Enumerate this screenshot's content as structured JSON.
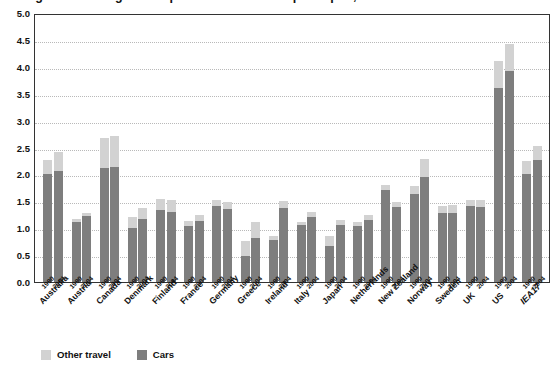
{
  "chart_data": {
    "type": "bar",
    "title": "Figure: Passenger transport CO2 emissions per capita, 1990 and 2004",
    "subtitle": "",
    "xlabel": "",
    "ylabel": "t CO2 per capita",
    "ylim": [
      0.0,
      5.0
    ],
    "ytick_step": 0.5,
    "ytick_labels": [
      "0.0",
      "0.5",
      "1.0",
      "1.5",
      "2.0",
      "2.5",
      "3.0",
      "3.5",
      "4.0",
      "4.5",
      "5.0"
    ],
    "grid": true,
    "stacked": true,
    "legend_position": "bottom-left",
    "legend": [
      "Other travel",
      "Cars"
    ],
    "series": [
      {
        "name": "Cars",
        "color": "#7e7e7e"
      },
      {
        "name": "Other travel",
        "color": "#d2d2d2"
      }
    ],
    "year_labels": [
      "1990",
      "2004"
    ],
    "categories": [
      "Australia",
      "Austria",
      "Canada",
      "Denmark",
      "Finland",
      "France",
      "Germany",
      "Greece",
      "Ireland",
      "Italy",
      "Japan",
      "Netherlands",
      "New Zealand",
      "Norway",
      "Sweden",
      "UK",
      "US",
      "IEA17"
    ],
    "emphasized_categories": [
      "IEA17"
    ],
    "groups": [
      {
        "category": "Australia",
        "emphasis": false,
        "bars": [
          {
            "year": "1990",
            "cars": 2.0,
            "other": 0.26,
            "total": 2.26
          },
          {
            "year": "2004",
            "cars": 2.07,
            "other": 0.35,
            "total": 2.42
          }
        ]
      },
      {
        "category": "Austria",
        "emphasis": false,
        "bars": [
          {
            "year": "1990",
            "cars": 1.11,
            "other": 0.07,
            "total": 1.18
          },
          {
            "year": "2004",
            "cars": 1.22,
            "other": 0.07,
            "total": 1.29
          }
        ]
      },
      {
        "category": "Canada",
        "emphasis": false,
        "bars": [
          {
            "year": "1990",
            "cars": 2.12,
            "other": 0.55,
            "total": 2.67
          },
          {
            "year": "2004",
            "cars": 2.13,
            "other": 0.59,
            "total": 2.72
          }
        ]
      },
      {
        "category": "Denmark",
        "emphasis": false,
        "bars": [
          {
            "year": "1990",
            "cars": 1.0,
            "other": 0.21,
            "total": 1.21
          },
          {
            "year": "2004",
            "cars": 1.18,
            "other": 0.2,
            "total": 1.38
          }
        ]
      },
      {
        "category": "Finland",
        "emphasis": false,
        "bars": [
          {
            "year": "1990",
            "cars": 1.34,
            "other": 0.21,
            "total": 1.55
          },
          {
            "year": "2004",
            "cars": 1.31,
            "other": 0.21,
            "total": 1.52
          }
        ]
      },
      {
        "category": "France",
        "emphasis": false,
        "bars": [
          {
            "year": "1990",
            "cars": 1.04,
            "other": 0.1,
            "total": 1.14
          },
          {
            "year": "2004",
            "cars": 1.14,
            "other": 0.1,
            "total": 1.24
          }
        ]
      },
      {
        "category": "Germany",
        "emphasis": false,
        "bars": [
          {
            "year": "1990",
            "cars": 1.41,
            "other": 0.11,
            "total": 1.52
          },
          {
            "year": "2004",
            "cars": 1.35,
            "other": 0.14,
            "total": 1.49
          }
        ]
      },
      {
        "category": "Greece",
        "emphasis": false,
        "bars": [
          {
            "year": "1990",
            "cars": 0.48,
            "other": 0.28,
            "total": 0.76
          },
          {
            "year": "2004",
            "cars": 0.82,
            "other": 0.3,
            "total": 1.12
          }
        ]
      },
      {
        "category": "Ireland",
        "emphasis": false,
        "bars": [
          {
            "year": "1990",
            "cars": 0.78,
            "other": 0.08,
            "total": 0.86
          },
          {
            "year": "2004",
            "cars": 1.38,
            "other": 0.13,
            "total": 1.51
          }
        ]
      },
      {
        "category": "Italy",
        "emphasis": false,
        "bars": [
          {
            "year": "1990",
            "cars": 1.06,
            "other": 0.06,
            "total": 1.12
          },
          {
            "year": "2004",
            "cars": 1.2,
            "other": 0.11,
            "total": 1.31
          }
        ]
      },
      {
        "category": "Japan",
        "emphasis": false,
        "bars": [
          {
            "year": "1990",
            "cars": 0.67,
            "other": 0.18,
            "total": 0.85
          },
          {
            "year": "2004",
            "cars": 1.06,
            "other": 0.1,
            "total": 1.16
          }
        ]
      },
      {
        "category": "Netherlands",
        "emphasis": false,
        "bars": [
          {
            "year": "1990",
            "cars": 1.05,
            "other": 0.07,
            "total": 1.12
          },
          {
            "year": "2004",
            "cars": 1.15,
            "other": 0.1,
            "total": 1.25
          }
        ]
      },
      {
        "category": "New Zealand",
        "emphasis": false,
        "bars": [
          {
            "year": "1990",
            "cars": 1.71,
            "other": 0.09,
            "total": 1.8
          },
          {
            "year": "2004",
            "cars": 1.4,
            "other": 0.08,
            "total": 1.48
          }
        ]
      },
      {
        "category": "Norway",
        "emphasis": false,
        "bars": [
          {
            "year": "1990",
            "cars": 1.64,
            "other": 0.15,
            "total": 1.79
          },
          {
            "year": "2004",
            "cars": 1.95,
            "other": 0.34,
            "total": 2.29
          }
        ]
      },
      {
        "category": "Sweden",
        "emphasis": false,
        "bars": [
          {
            "year": "1990",
            "cars": 1.28,
            "other": 0.14,
            "total": 1.42
          },
          {
            "year": "2004",
            "cars": 1.28,
            "other": 0.16,
            "total": 1.44
          }
        ]
      },
      {
        "category": "UK",
        "emphasis": false,
        "bars": [
          {
            "year": "1990",
            "cars": 1.41,
            "other": 0.11,
            "total": 1.52
          },
          {
            "year": "2004",
            "cars": 1.4,
            "other": 0.12,
            "total": 1.52
          }
        ]
      },
      {
        "category": "US",
        "emphasis": false,
        "bars": [
          {
            "year": "1990",
            "cars": 3.61,
            "other": 0.49,
            "total": 4.1
          },
          {
            "year": "2004",
            "cars": 3.92,
            "other": 0.5,
            "total": 4.42
          }
        ]
      },
      {
        "category": "IEA17",
        "emphasis": true,
        "bars": [
          {
            "year": "1990",
            "cars": 2.0,
            "other": 0.25,
            "total": 2.25
          },
          {
            "year": "2004",
            "cars": 2.27,
            "other": 0.25,
            "total": 2.52
          }
        ]
      }
    ]
  },
  "legend": {
    "other_travel": "Other travel",
    "cars": "Cars"
  }
}
